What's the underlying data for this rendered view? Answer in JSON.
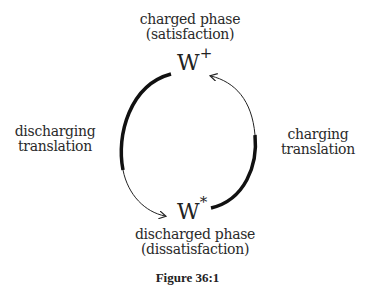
{
  "diagram": {
    "top_node": {
      "symbol": "W",
      "superscript": "+",
      "label_line1": "charged phase",
      "label_line2": "(satisfaction)"
    },
    "bottom_node": {
      "symbol": "W",
      "superscript": "*",
      "label_line1": "discharged phase",
      "label_line2": "(dissatisfaction)"
    },
    "left_edge": {
      "label_line1": "discharging",
      "label_line2": "translation",
      "direction": "top-to-bottom"
    },
    "right_edge": {
      "label_line1": "charging",
      "label_line2": "translation",
      "direction": "bottom-to-top"
    }
  },
  "caption": "Figure 36:1"
}
